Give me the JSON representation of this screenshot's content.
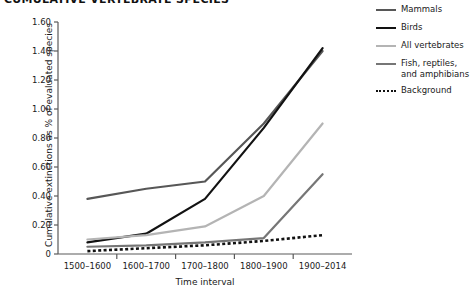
{
  "chart_data": {
    "type": "line",
    "title": "CUMULATIVE VERTEBRATE SPECIES",
    "xlabel": "Time interval",
    "ylabel": "Cumulative extinctions as % of evaluated species",
    "categories": [
      "1500–1600",
      "1600–1700",
      "1700–1800",
      "1800–1900",
      "1900–2014"
    ],
    "ylim": [
      0,
      1.6
    ],
    "yticks": [
      "0",
      "0.20",
      "0.40",
      "0.60",
      "0.80",
      "1.00",
      "1.20",
      "1.40",
      "1.60"
    ],
    "ytick_values": [
      0,
      0.2,
      0.4,
      0.6,
      0.8,
      1.0,
      1.2,
      1.4,
      1.6
    ],
    "grid": false,
    "legend_position": "right",
    "series": [
      {
        "name": "Mammals",
        "color": "#575757",
        "width": 2.2,
        "dash": "none",
        "values": [
          0.38,
          0.45,
          0.5,
          0.9,
          1.4
        ]
      },
      {
        "name": "Birds",
        "color": "#121212",
        "width": 2.2,
        "dash": "none",
        "values": [
          0.08,
          0.14,
          0.38,
          0.87,
          1.42
        ]
      },
      {
        "name": "All vertebrates",
        "color": "#b4b4b4",
        "width": 2.2,
        "dash": "none",
        "values": [
          0.1,
          0.13,
          0.19,
          0.4,
          0.9
        ]
      },
      {
        "name": "Fish, reptiles,\nand amphibians",
        "color": "#767676",
        "width": 2.2,
        "dash": "none",
        "values": [
          0.05,
          0.06,
          0.08,
          0.11,
          0.55
        ]
      },
      {
        "name": "Background",
        "color": "#111111",
        "width": 2.6,
        "dash": "3,2.4",
        "values": [
          0.02,
          0.04,
          0.06,
          0.09,
          0.13
        ]
      }
    ]
  },
  "axis": {
    "color": "#5a5a5a"
  }
}
